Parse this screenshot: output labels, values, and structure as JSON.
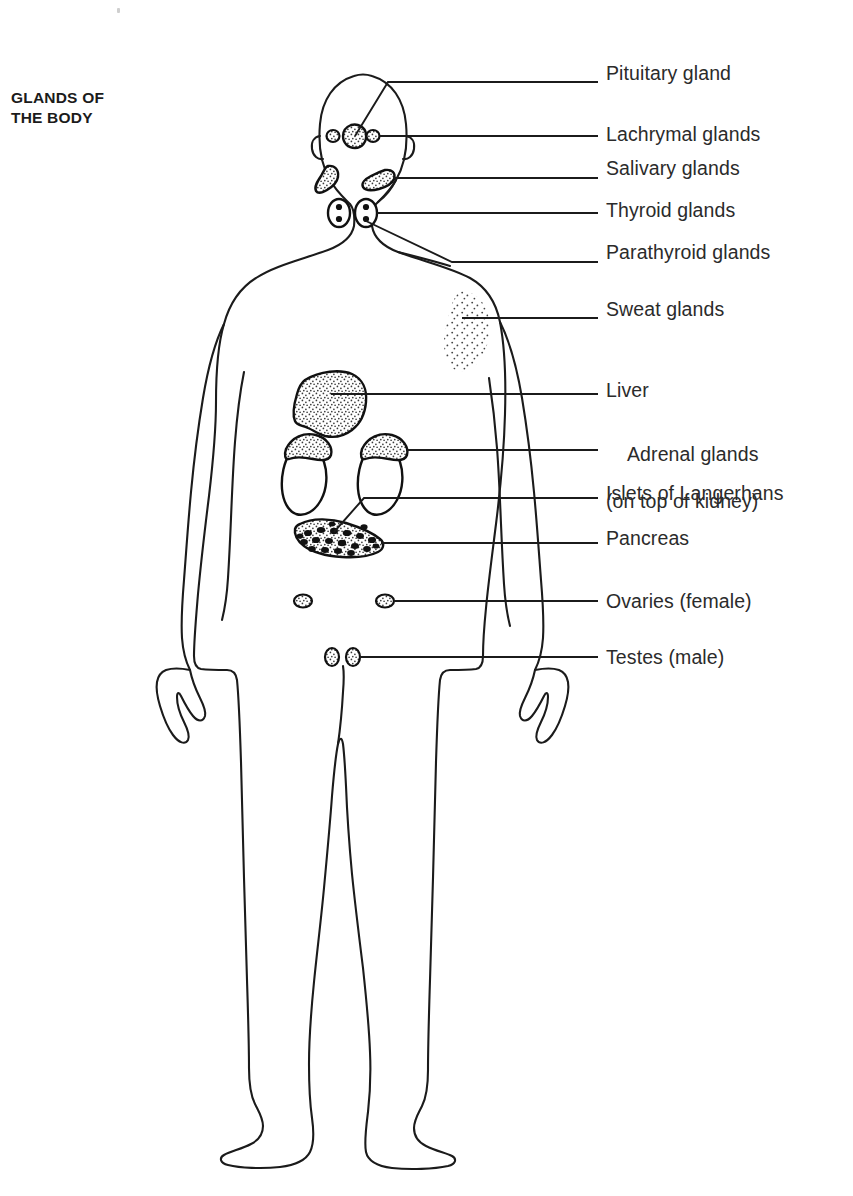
{
  "figure": {
    "title_line_1": "GLANDS OF",
    "title_line_2": "THE BODY",
    "background_color": "#ffffff",
    "ink_color": "#1b1b1b"
  },
  "labels": [
    {
      "id": "pituitary",
      "text": "Pituitary gland",
      "text2": "",
      "x": 606,
      "y": 62,
      "leader_y": 74
    },
    {
      "id": "lachrymal",
      "text": "Lachrymal glands",
      "text2": "",
      "x": 606,
      "y": 123,
      "leader_y": 135
    },
    {
      "id": "salivary",
      "text": "Salivary glands",
      "text2": "",
      "x": 606,
      "y": 157,
      "leader_y": 172
    },
    {
      "id": "thyroid",
      "text": "Thyroid glands",
      "text2": "",
      "x": 606,
      "y": 198,
      "leader_y": 212
    },
    {
      "id": "parathyroid",
      "text": "Parathyroid glands",
      "text2": "",
      "x": 606,
      "y": 241,
      "leader_y": 255
    },
    {
      "id": "sweat",
      "text": "Sweat glands",
      "text2": "",
      "x": 606,
      "y": 298,
      "leader_y": 312
    },
    {
      "id": "liver",
      "text": "Liver",
      "text2": "",
      "x": 606,
      "y": 379,
      "leader_y": 393
    },
    {
      "id": "adrenal",
      "text": "Adrenal glands",
      "text2": "(on top of kidney)",
      "x": 606,
      "y": 420,
      "leader_y": 449
    },
    {
      "id": "islets",
      "text": "Islets of Langerhans",
      "text2": "",
      "x": 606,
      "y": 482,
      "leader_y": 495
    },
    {
      "id": "pancreas",
      "text": "Pancreas",
      "text2": "",
      "x": 606,
      "y": 527,
      "leader_y": 540
    },
    {
      "id": "ovaries",
      "text": "Ovaries (female)",
      "text2": "",
      "x": 606,
      "y": 590,
      "leader_y": 603
    },
    {
      "id": "testes",
      "text": "Testes (male)",
      "text2": "",
      "x": 606,
      "y": 646,
      "leader_y": 659
    }
  ],
  "organs": [
    {
      "id": "pituitary-gland",
      "name": "Pituitary gland",
      "count": 1,
      "fill": "stipple"
    },
    {
      "id": "lachrymal-glands",
      "name": "Lachrymal glands",
      "count": 2,
      "fill": "stipple"
    },
    {
      "id": "salivary-glands",
      "name": "Salivary glands",
      "count": 2,
      "fill": "stipple"
    },
    {
      "id": "thyroid-glands",
      "name": "Thyroid glands",
      "count": 2,
      "fill": "white"
    },
    {
      "id": "parathyroid",
      "name": "Parathyroid glands",
      "count": 4,
      "fill": "solid"
    },
    {
      "id": "sweat-glands",
      "name": "Sweat glands",
      "count": 1,
      "fill": "sparse-stipple"
    },
    {
      "id": "liver",
      "name": "Liver",
      "count": 1,
      "fill": "stipple"
    },
    {
      "id": "kidneys",
      "name": "Kidneys",
      "count": 2,
      "fill": "white"
    },
    {
      "id": "adrenal-glands",
      "name": "Adrenal glands",
      "count": 2,
      "fill": "stipple"
    },
    {
      "id": "pancreas",
      "name": "Pancreas",
      "count": 1,
      "fill": "stipple"
    },
    {
      "id": "islets",
      "name": "Islets of Langerhans",
      "count": 20,
      "fill": "solid"
    },
    {
      "id": "ovaries",
      "name": "Ovaries",
      "count": 2,
      "fill": "stipple"
    },
    {
      "id": "testes",
      "name": "Testes",
      "count": 2,
      "fill": "stipple"
    }
  ]
}
